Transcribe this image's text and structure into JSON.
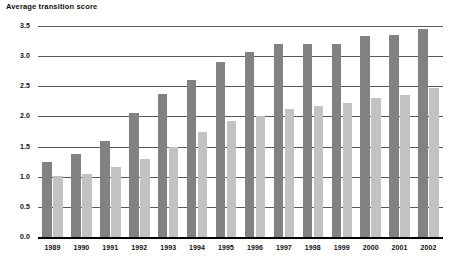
{
  "chart_data": {
    "type": "bar",
    "title": "Average transition score",
    "xlabel": "",
    "ylabel": "Average transition score",
    "ylim": [
      0.0,
      3.5
    ],
    "ytick_labels": [
      "0.0",
      "0.5",
      "1.0",
      "1.5",
      "2.0",
      "2.5",
      "3.0",
      "3.5"
    ],
    "ytick_values": [
      0.0,
      0.5,
      1.0,
      1.5,
      2.0,
      2.5,
      3.0,
      3.5
    ],
    "grid": true,
    "legend": null,
    "categories": [
      "1989",
      "1990",
      "1991",
      "1992",
      "1993",
      "1994",
      "1995",
      "1996",
      "1997",
      "1998",
      "1999",
      "2000",
      "2001",
      "2002"
    ],
    "series": [
      {
        "name": "series-1",
        "color": "#828282",
        "values": [
          1.25,
          1.37,
          1.6,
          2.05,
          2.38,
          2.6,
          2.9,
          3.07,
          3.2,
          3.2,
          3.2,
          3.33,
          3.35,
          3.45
        ]
      },
      {
        "name": "series-2",
        "color": "#c2c2c2",
        "values": [
          1.02,
          1.05,
          1.17,
          1.3,
          1.5,
          1.75,
          1.92,
          2.0,
          2.12,
          2.18,
          2.23,
          2.3,
          2.35,
          2.47
        ]
      }
    ]
  },
  "colors": {
    "series_1": "#828282",
    "series_2": "#c2c2c2",
    "gridline": "#5a5a5a",
    "axis": "#000000",
    "text": "#111111",
    "background": "#ffffff"
  }
}
